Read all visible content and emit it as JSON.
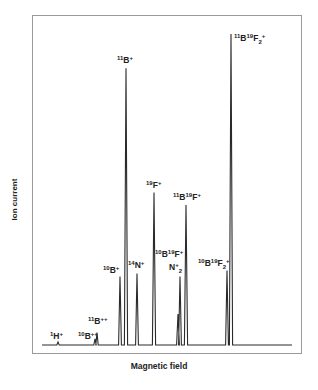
{
  "chart_data": {
    "type": "line",
    "title": "",
    "xlabel": "Magnetic field",
    "ylabel": "Ion current",
    "grid": false,
    "legend": null,
    "axis_ticks": false,
    "ylim": [
      0,
      100
    ],
    "units_note": "relative ion current, tallest peak = 100 (estimated from pixel heights)",
    "peaks": [
      {
        "label": "1H+",
        "label_parts": [
          [
            "1",
            "sup"
          ],
          [
            "H",
            ""
          ],
          [
            "+",
            "sup"
          ]
        ],
        "x": 58,
        "height": 1
      },
      {
        "label": "10B++",
        "label_parts": [
          [
            "10",
            "sup"
          ],
          [
            "B",
            ""
          ],
          [
            "++",
            "sup"
          ]
        ],
        "x": 95,
        "height": 2
      },
      {
        "label": "11B++",
        "label_parts": [
          [
            "11",
            "sup"
          ],
          [
            "B",
            ""
          ],
          [
            "++",
            "sup"
          ]
        ],
        "x": 97,
        "height": 4
      },
      {
        "label": "10B+",
        "label_parts": [
          [
            "10",
            "sup"
          ],
          [
            "B",
            ""
          ],
          [
            "+",
            "sup"
          ]
        ],
        "x": 120,
        "height": 22
      },
      {
        "label": "11B+",
        "label_parts": [
          [
            "11",
            "sup"
          ],
          [
            "B",
            ""
          ],
          [
            "+",
            "sup"
          ]
        ],
        "x": 126,
        "height": 89
      },
      {
        "label": "14N+",
        "label_parts": [
          [
            "14",
            "sup"
          ],
          [
            "N",
            ""
          ],
          [
            "+",
            "sup"
          ]
        ],
        "x": 137,
        "height": 23
      },
      {
        "label": "19F+",
        "label_parts": [
          [
            "19",
            "sup"
          ],
          [
            "F",
            ""
          ],
          [
            "+",
            "sup"
          ]
        ],
        "x": 154,
        "height": 49
      },
      {
        "label": "10B19F+",
        "label_parts": [
          [
            "10",
            "sup"
          ],
          [
            "B",
            ""
          ],
          [
            "19",
            "sup"
          ],
          [
            "F",
            ""
          ],
          [
            "+",
            "sup"
          ]
        ],
        "x": 178,
        "height": 10
      },
      {
        "label": "N2+",
        "label_parts": [
          [
            "N",
            ""
          ],
          [
            "+",
            "sup"
          ],
          [
            "2",
            "sub"
          ]
        ],
        "x": 180,
        "height": 22
      },
      {
        "label": "11B19F+",
        "label_parts": [
          [
            "11",
            "sup"
          ],
          [
            "B",
            ""
          ],
          [
            "19",
            "sup"
          ],
          [
            "F",
            ""
          ],
          [
            "+",
            "sup"
          ]
        ],
        "x": 186,
        "height": 45
      },
      {
        "label": "10B19F2+",
        "label_parts": [
          [
            "10",
            "sup"
          ],
          [
            "B",
            ""
          ],
          [
            "19",
            "sup"
          ],
          [
            "F",
            ""
          ],
          [
            "2",
            "sub"
          ],
          [
            "+",
            "sup"
          ]
        ],
        "x": 227,
        "height": 24
      },
      {
        "label": "11B19F2+",
        "label_parts": [
          [
            "11",
            "sup"
          ],
          [
            "B",
            ""
          ],
          [
            "19",
            "sup"
          ],
          [
            "F",
            ""
          ],
          [
            "2",
            "sub"
          ],
          [
            "+",
            "sup"
          ]
        ],
        "x": 231,
        "height": 100
      }
    ],
    "baseline_x_range": [
      42,
      292
    ]
  },
  "axes": {
    "xlabel": "Magnetic field",
    "ylabel": "Ion current"
  },
  "colors": {
    "trace": "#2a2a2a",
    "frame": "#9a9a9a",
    "text": "#222222"
  }
}
